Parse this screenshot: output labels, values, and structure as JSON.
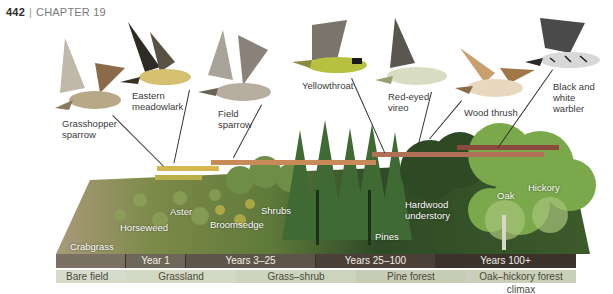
{
  "header": {
    "page_number": "442",
    "chapter": "CHAPTER 19"
  },
  "birds": [
    {
      "name": "Grasshopper\nsparrow",
      "id": "grasshopper-sparrow"
    },
    {
      "name": "Eastern\nmeadowlark",
      "id": "eastern-meadowlark"
    },
    {
      "name": "Field\nsparrow",
      "id": "field-sparrow"
    },
    {
      "name": "Yellowthroat",
      "id": "yellowthroat"
    },
    {
      "name": "Red-eyed\nvireo",
      "id": "red-eyed-vireo"
    },
    {
      "name": "Wood thrush",
      "id": "wood-thrush"
    },
    {
      "name": "Black and\nwhite\nwarbler",
      "id": "black-and-white-warbler"
    }
  ],
  "plants": [
    {
      "name": "Crabgrass"
    },
    {
      "name": "Horseweed"
    },
    {
      "name": "Aster"
    },
    {
      "name": "Broomsedge"
    },
    {
      "name": "Shrubs"
    },
    {
      "name": "Pines"
    },
    {
      "name": "Hardwood\nunderstory"
    },
    {
      "name": "Oak"
    },
    {
      "name": "Hickory"
    }
  ],
  "timeline": [
    {
      "label": "",
      "width": 70
    },
    {
      "label": "Year 1",
      "width": 60
    },
    {
      "label": "Years 3–25",
      "width": 130
    },
    {
      "label": "Years 25–100",
      "width": 120
    },
    {
      "label": "Years 100+",
      "width": 140
    }
  ],
  "stages": [
    {
      "label": "Bare field",
      "width": 70
    },
    {
      "label": "Grassland",
      "width": 110
    },
    {
      "label": "Grass–shrub",
      "width": 120
    },
    {
      "label": "Pine forest",
      "width": 110
    },
    {
      "label": "Oak–hickory forest climax",
      "width": 110
    }
  ],
  "colors": {
    "bar_grassland_1": "#b8b04a",
    "bar_grassland_2": "#d2b84e",
    "bar_shrub": "#c98a5a",
    "bar_forest": "#b07058",
    "bar_climax": "#8a4a3e",
    "timeline_bg": "#6b6358",
    "timeline_dark": "#3a322b",
    "stage_bg": "#c9cfb8"
  }
}
